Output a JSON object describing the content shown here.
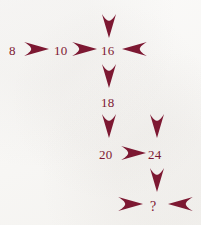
{
  "diagram": {
    "background_color": "#f7f6f4",
    "ink_color": "#7d1832",
    "nodes": [
      {
        "id": "n8",
        "label": "8",
        "x": 9,
        "y": 44
      },
      {
        "id": "n10",
        "label": "10",
        "x": 54,
        "y": 44
      },
      {
        "id": "n16",
        "label": "16",
        "x": 101,
        "y": 44
      },
      {
        "id": "n18",
        "label": "18",
        "x": 101,
        "y": 96
      },
      {
        "id": "n20",
        "label": "20",
        "x": 99,
        "y": 148
      },
      {
        "id": "n24",
        "label": "24",
        "x": 148,
        "y": 148
      },
      {
        "id": "nq",
        "label": "?",
        "x": 150,
        "y": 200
      }
    ],
    "arrows": [
      {
        "id": "a-8-to-10",
        "direction": "right",
        "x": 22,
        "y": 41,
        "w": 27,
        "h": 16
      },
      {
        "id": "a-10-to-16",
        "direction": "right",
        "x": 70,
        "y": 41,
        "w": 27,
        "h": 16
      },
      {
        "id": "a-top-into-16",
        "direction": "down",
        "x": 101,
        "y": 12,
        "w": 16,
        "h": 26
      },
      {
        "id": "a-right-into-16",
        "direction": "left",
        "x": 122,
        "y": 41,
        "w": 27,
        "h": 16
      },
      {
        "id": "a-16-to-18",
        "direction": "down",
        "x": 101,
        "y": 62,
        "w": 16,
        "h": 26
      },
      {
        "id": "a-18-to-20",
        "direction": "down",
        "x": 101,
        "y": 112,
        "w": 16,
        "h": 26
      },
      {
        "id": "a-into-24",
        "direction": "down",
        "x": 149,
        "y": 112,
        "w": 16,
        "h": 26
      },
      {
        "id": "a-20-to-24",
        "direction": "right",
        "x": 119,
        "y": 145,
        "w": 27,
        "h": 16
      },
      {
        "id": "a-24-to-q",
        "direction": "down",
        "x": 149,
        "y": 166,
        "w": 16,
        "h": 26
      },
      {
        "id": "a-left-into-q",
        "direction": "right",
        "x": 116,
        "y": 196,
        "w": 27,
        "h": 16
      },
      {
        "id": "a-right-into-q",
        "direction": "left",
        "x": 168,
        "y": 196,
        "w": 27,
        "h": 16
      }
    ],
    "sequence": [
      8,
      10,
      16,
      18,
      20,
      24,
      null
    ],
    "answer_placeholder": "?"
  }
}
